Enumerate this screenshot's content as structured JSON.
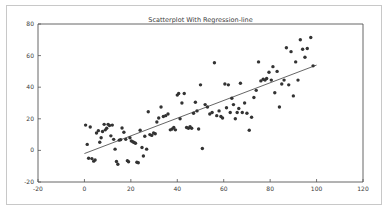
{
  "chart_data": {
    "type": "scatter",
    "title": "Scatterplot With Regression-line",
    "xlabel": "",
    "ylabel": "",
    "xlim": [
      -20,
      120
    ],
    "ylim": [
      -20,
      80
    ],
    "xticks": [
      -20,
      0,
      20,
      40,
      60,
      80,
      100,
      120
    ],
    "yticks": [
      -20,
      0,
      20,
      40,
      60,
      80
    ],
    "grid": false,
    "legend": null,
    "marker_color": "#333333",
    "line_color": "#555555",
    "axis_color": "#555555",
    "background_color": "#ffffff",
    "series": [
      {
        "name": "observations",
        "type": "scatter",
        "points": [
          [
            0.5,
            16.0
          ],
          [
            1.2,
            3.8
          ],
          [
            1.8,
            -5.0
          ],
          [
            2.5,
            14.8
          ],
          [
            3.2,
            -5.2
          ],
          [
            4.0,
            -6.8
          ],
          [
            4.6,
            -6.0
          ],
          [
            5.2,
            11.0
          ],
          [
            6.0,
            12.5
          ],
          [
            6.6,
            5.2
          ],
          [
            7.2,
            8.0
          ],
          [
            7.8,
            12.0
          ],
          [
            8.5,
            16.5
          ],
          [
            9.0,
            13.0
          ],
          [
            9.6,
            14.0
          ],
          [
            10.2,
            16.5
          ],
          [
            10.8,
            15.8
          ],
          [
            11.4,
            9.2
          ],
          [
            12.0,
            16.0
          ],
          [
            12.6,
            7.0
          ],
          [
            13.2,
            0.8
          ],
          [
            13.8,
            -7.0
          ],
          [
            14.4,
            -8.8
          ],
          [
            15.0,
            6.5
          ],
          [
            15.6,
            6.8
          ],
          [
            16.2,
            14.2
          ],
          [
            17.0,
            11.5
          ],
          [
            17.8,
            7.0
          ],
          [
            18.5,
            -6.5
          ],
          [
            19.0,
            -7.2
          ],
          [
            19.6,
            8.0
          ],
          [
            20.2,
            6.0
          ],
          [
            20.8,
            5.5
          ],
          [
            21.4,
            5.0
          ],
          [
            22.0,
            4.5
          ],
          [
            22.6,
            -7.5
          ],
          [
            23.2,
            -7.8
          ],
          [
            24.0,
            12.8
          ],
          [
            24.8,
            1.8
          ],
          [
            25.4,
            -3.5
          ],
          [
            26.0,
            9.0
          ],
          [
            26.8,
            0.8
          ],
          [
            27.5,
            24.5
          ],
          [
            28.2,
            10.0
          ],
          [
            29.0,
            9.5
          ],
          [
            29.8,
            11.0
          ],
          [
            30.5,
            10.5
          ],
          [
            31.2,
            18.0
          ],
          [
            32.0,
            20.5
          ],
          [
            33.0,
            27.5
          ],
          [
            34.0,
            21.5
          ],
          [
            35.0,
            22.0
          ],
          [
            36.0,
            23.0
          ],
          [
            37.0,
            13.0
          ],
          [
            37.8,
            13.5
          ],
          [
            38.5,
            14.5
          ],
          [
            39.2,
            13.0
          ],
          [
            40.0,
            35.0
          ],
          [
            40.6,
            36.0
          ],
          [
            41.2,
            20.0
          ],
          [
            42.0,
            30.0
          ],
          [
            43.0,
            36.0
          ],
          [
            44.0,
            14.5
          ],
          [
            44.8,
            14.0
          ],
          [
            45.5,
            15.0
          ],
          [
            46.2,
            14.0
          ],
          [
            47.0,
            23.5
          ],
          [
            47.8,
            30.5
          ],
          [
            48.5,
            25.0
          ],
          [
            49.2,
            13.5
          ],
          [
            50.0,
            41.5
          ],
          [
            50.8,
            1.2
          ],
          [
            52.0,
            29.0
          ],
          [
            53.0,
            27.5
          ],
          [
            54.0,
            23.0
          ],
          [
            55.0,
            24.0
          ],
          [
            56.0,
            55.5
          ],
          [
            57.0,
            22.0
          ],
          [
            58.0,
            25.0
          ],
          [
            58.8,
            21.5
          ],
          [
            59.5,
            20.5
          ],
          [
            60.5,
            42.0
          ],
          [
            61.2,
            27.0
          ],
          [
            62.0,
            41.5
          ],
          [
            62.8,
            24.0
          ],
          [
            63.5,
            33.0
          ],
          [
            64.2,
            29.0
          ],
          [
            65.0,
            20.0
          ],
          [
            65.8,
            24.0
          ],
          [
            66.5,
            26.5
          ],
          [
            67.2,
            42.5
          ],
          [
            68.0,
            24.0
          ],
          [
            69.0,
            30.0
          ],
          [
            70.0,
            23.5
          ],
          [
            71.0,
            12.8
          ],
          [
            72.0,
            21.0
          ],
          [
            73.0,
            33.5
          ],
          [
            74.0,
            38.0
          ],
          [
            75.0,
            56.0
          ],
          [
            76.0,
            44.0
          ],
          [
            77.0,
            45.0
          ],
          [
            77.8,
            44.5
          ],
          [
            78.5,
            45.5
          ],
          [
            79.5,
            49.5
          ],
          [
            80.5,
            44.5
          ],
          [
            81.2,
            53.0
          ],
          [
            82.0,
            36.5
          ],
          [
            83.0,
            50.0
          ],
          [
            84.0,
            27.5
          ],
          [
            85.0,
            42.0
          ],
          [
            86.0,
            44.5
          ],
          [
            87.0,
            65.0
          ],
          [
            88.0,
            41.5
          ],
          [
            89.0,
            62.5
          ],
          [
            90.0,
            34.5
          ],
          [
            91.0,
            56.0
          ],
          [
            92.0,
            44.5
          ],
          [
            93.0,
            70.0
          ],
          [
            94.0,
            64.0
          ],
          [
            95.0,
            59.0
          ],
          [
            96.0,
            64.5
          ],
          [
            97.5,
            71.5
          ],
          [
            98.5,
            53.5
          ]
        ]
      },
      {
        "name": "regression-line",
        "type": "line",
        "x": [
          0,
          100
        ],
        "y": [
          -2.0,
          54.0
        ],
        "slope": 0.56,
        "intercept": -2.0
      }
    ]
  }
}
